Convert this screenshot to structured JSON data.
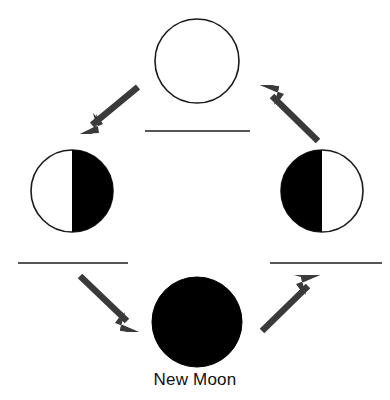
{
  "diagram": {
    "background_color": "#ffffff",
    "outline_color": "#1a1a1a",
    "shadow_color": "#000000",
    "lit_color": "#ffffff",
    "arrow_color": "#3a3a3a",
    "answer_line_color": "#555555",
    "width": 390,
    "height": 400
  },
  "moons": [
    {
      "id": "full-moon",
      "position": "top",
      "fill_style": "outline-only",
      "lit_side": "all",
      "label": "",
      "cx": 197,
      "cy": 61,
      "r": 42
    },
    {
      "id": "third-quarter-moon",
      "position": "left",
      "fill_style": "half",
      "lit_side": "left",
      "label": "",
      "cx": 72,
      "cy": 191,
      "r": 41
    },
    {
      "id": "first-quarter-moon",
      "position": "right",
      "fill_style": "half",
      "lit_side": "right",
      "label": "",
      "cx": 322,
      "cy": 191,
      "r": 41
    },
    {
      "id": "new-moon",
      "position": "bottom",
      "fill_style": "solid",
      "lit_side": "none",
      "label": "New Moon",
      "cx": 197,
      "cy": 322,
      "r": 45
    }
  ],
  "answer_lines": [
    {
      "id": "answer-line-top",
      "x1": 145,
      "y1": 131,
      "x2": 250,
      "y2": 131
    },
    {
      "id": "answer-line-left",
      "x1": 18,
      "y1": 263,
      "x2": 128,
      "y2": 263
    },
    {
      "id": "answer-line-right",
      "x1": 270,
      "y1": 263,
      "x2": 382,
      "y2": 263
    }
  ],
  "arrows": [
    {
      "id": "arrow-full-to-third-quarter",
      "from": "full-moon",
      "to": "third-quarter-moon",
      "x1": 138,
      "y1": 87,
      "x2": 84,
      "y2": 132
    },
    {
      "id": "arrow-third-quarter-to-new",
      "from": "third-quarter-moon",
      "to": "new-moon",
      "x1": 80,
      "y1": 276,
      "x2": 136,
      "y2": 331
    },
    {
      "id": "arrow-new-to-first-quarter",
      "from": "new-moon",
      "to": "first-quarter-moon",
      "x1": 262,
      "y1": 331,
      "x2": 318,
      "y2": 276
    },
    {
      "id": "arrow-first-quarter-to-full",
      "from": "first-quarter-moon",
      "to": "full-moon",
      "x1": 318,
      "y1": 141,
      "x2": 263,
      "y2": 86
    }
  ]
}
